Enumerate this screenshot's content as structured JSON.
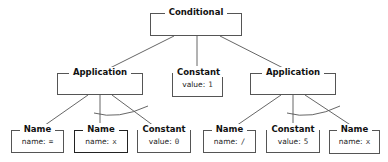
{
  "diagram": {
    "type": "abstract-syntax-tree",
    "root": {
      "id": "conditional",
      "label": "Conditional"
    },
    "level1": [
      {
        "id": "app-left",
        "label": "Application"
      },
      {
        "id": "const-mid",
        "label": "Constant",
        "key": "value:",
        "value": "1"
      },
      {
        "id": "app-right",
        "label": "Application"
      }
    ],
    "level2": [
      {
        "id": "name-eq",
        "label": "Name",
        "key": "name:",
        "value": "="
      },
      {
        "id": "name-x1",
        "label": "Name",
        "key": "name:",
        "value": "x"
      },
      {
        "id": "const-0",
        "label": "Constant",
        "key": "value:",
        "value": "0"
      },
      {
        "id": "name-div",
        "label": "Name",
        "key": "name:",
        "value": "/"
      },
      {
        "id": "const-5",
        "label": "Constant",
        "key": "value:",
        "value": "5"
      },
      {
        "id": "name-x2",
        "label": "Name",
        "key": "name:",
        "value": "x"
      }
    ],
    "edges": [
      [
        "conditional",
        "app-left"
      ],
      [
        "conditional",
        "const-mid"
      ],
      [
        "conditional",
        "app-right"
      ],
      [
        "app-left",
        "name-eq"
      ],
      [
        "app-left",
        "name-x1"
      ],
      [
        "app-left",
        "const-0"
      ],
      [
        "app-right",
        "name-div"
      ],
      [
        "app-right",
        "const-5"
      ],
      [
        "app-right",
        "name-x2"
      ]
    ],
    "colors": {
      "line": "#555555",
      "text": "#111111",
      "background": "#ffffff"
    }
  }
}
